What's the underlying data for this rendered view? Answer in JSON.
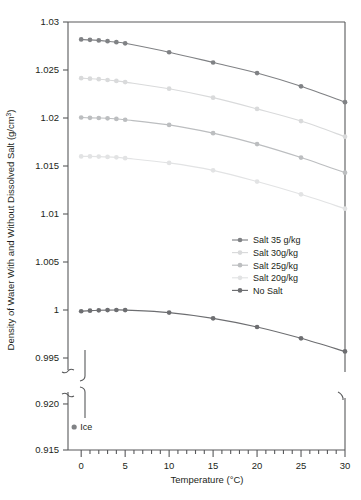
{
  "chart_data": {
    "type": "line",
    "title": "",
    "xlabel": "Temperature (°C)",
    "ylabel": "Density of Water With and Without Dissolved Salt (g/cm³)",
    "x": [
      0,
      1,
      2,
      3,
      4,
      5,
      10,
      15,
      20,
      25,
      30
    ],
    "xlim": [
      -1.5,
      30
    ],
    "xticks": [
      0,
      1,
      2,
      3,
      4,
      5,
      6,
      7,
      8,
      9,
      10,
      11,
      12,
      13,
      14,
      15,
      16,
      17,
      18,
      19,
      20,
      21,
      22,
      23,
      24,
      25,
      26,
      27,
      28,
      29,
      30
    ],
    "xticklabels": [
      "0",
      "5",
      "10",
      "15",
      "20",
      "25",
      "30"
    ],
    "xticklabel_values": [
      0,
      5,
      10,
      15,
      20,
      25,
      30
    ],
    "upper_panel": {
      "ylim": [
        0.99375,
        1.03
      ],
      "yticks": [
        0.995,
        1,
        1.005,
        1.01,
        1.015,
        1.02,
        1.025,
        1.03
      ],
      "yticklabels": [
        "0.995",
        "1",
        "1.005",
        "1.01",
        "1.015",
        "1.02",
        "1.025",
        "1.03"
      ]
    },
    "lower_panel": {
      "ylim": [
        0.915,
        0.9213
      ],
      "yticks": [
        0.915,
        0.92
      ],
      "yticklabels": [
        "0.915",
        "0.920"
      ]
    },
    "broken_axis": true,
    "grid": false,
    "legend_position": "center-right",
    "series": [
      {
        "name": "Salt 35 g/kg",
        "color": "#808285",
        "values": [
          1.02818,
          1.02814,
          1.02808,
          1.028,
          1.0279,
          1.02778,
          1.02685,
          1.02578,
          1.02468,
          1.0233,
          1.02165
        ]
      },
      {
        "name": "Salt 30g/kg",
        "color": "#d9dadb",
        "values": [
          1.02415,
          1.0241,
          1.02404,
          1.02396,
          1.02386,
          1.02374,
          1.02305,
          1.02212,
          1.02095,
          1.01968,
          1.01805
        ]
      },
      {
        "name": "Salt 25g/kg",
        "color": "#bcbec0",
        "values": [
          1.02005,
          1.02002,
          1.02,
          1.01997,
          1.0199,
          1.01982,
          1.01928,
          1.01842,
          1.01728,
          1.01588,
          1.0143
        ]
      },
      {
        "name": "Salt 20g/kg",
        "color": "#e2e3e4",
        "values": [
          1.016,
          1.016,
          1.01598,
          1.01595,
          1.0159,
          1.01582,
          1.01532,
          1.01455,
          1.01338,
          1.01205,
          1.01055
        ]
      },
      {
        "name": "No Salt",
        "color": "#6d6e71",
        "values": [
          0.99987,
          0.99993,
          0.99997,
          0.99999,
          1.0,
          0.99999,
          0.99973,
          0.99913,
          0.99823,
          0.99705,
          0.99568
        ]
      }
    ],
    "annotations": [
      {
        "label": "Ice",
        "x": -0.8,
        "y": 0.9175,
        "color": "#808285",
        "panel": "lower"
      }
    ]
  }
}
